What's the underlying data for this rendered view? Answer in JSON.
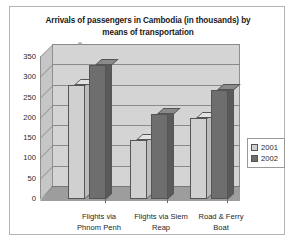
{
  "chart_data": {
    "type": "bar",
    "title": "Arrivals of passengers in Cambodia (in thousands)  by means of transportation",
    "title_line1": "Arrivals of passengers in Cambodia (in thousands)  by",
    "title_line2": "means of transportation",
    "xlabel": "",
    "ylabel": "",
    "ylim": [
      0,
      350
    ],
    "yticks": [
      0,
      50,
      100,
      150,
      200,
      250,
      300,
      350
    ],
    "grid": true,
    "legend_position": "right",
    "style": "3d-clustered-column",
    "categories": [
      "Flights via Phnom Penh",
      "Flights via Siem Reap",
      "Road & Ferry Boat"
    ],
    "category_lines": [
      [
        "Flights via",
        "Phnom Penh"
      ],
      [
        "Flights via Siem",
        "Reap"
      ],
      [
        "Road & Ferry",
        "Boat"
      ]
    ],
    "series": [
      {
        "name": "2001",
        "color": "#d0d0d0",
        "values": [
          280,
          145,
          200
        ]
      },
      {
        "name": "2002",
        "color": "#6e6e6e",
        "values": [
          330,
          210,
          268
        ]
      }
    ]
  },
  "legend": {
    "entries": [
      {
        "label": "2001"
      },
      {
        "label": "2002"
      }
    ]
  }
}
